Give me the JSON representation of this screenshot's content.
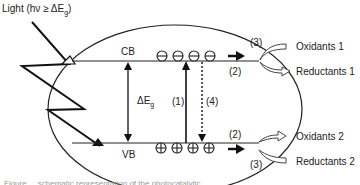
{
  "diagram": {
    "light_label": {
      "prefix": "Light (h",
      "nu": "ν",
      "geq": " ≥ ΔE",
      "sub": "g",
      "suffix": ")"
    },
    "bands": {
      "conduction": "CB",
      "valence": "VB"
    },
    "band_gap": {
      "symbol": "ΔE",
      "sub": "g"
    },
    "process_labels": {
      "excitation": "(1)",
      "migration_cb": "(2)",
      "migration_vb": "(2)",
      "reaction_cb": "(3)",
      "reaction_vb": "(3)",
      "recombination": "(4)"
    },
    "carriers": {
      "electrons": [
        "⊖",
        "⊖",
        "⊖",
        "⊖"
      ],
      "holes": [
        "⊕",
        "⊕",
        "⊕",
        "⊕"
      ]
    },
    "products": {
      "cb_in": "Oxidants 1",
      "cb_out": "Reductants 1",
      "vb_out": "Oxidants 2",
      "vb_in": "Reductants 2"
    },
    "caption_fragment": "Figure ... schematic representation of the photocatalytic ..."
  }
}
